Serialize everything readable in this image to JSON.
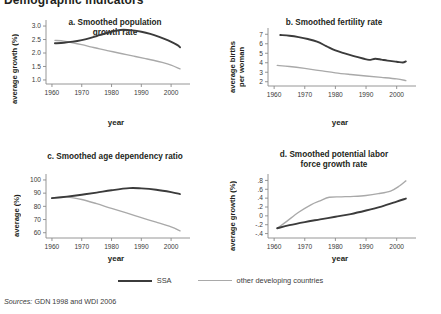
{
  "figure": {
    "main_title": "Demographic indicators",
    "source_prefix": "Sources:",
    "source_text": "GDN 1998 and WDI 2006"
  },
  "legend": {
    "position": "bottom-center",
    "entries": [
      {
        "label": "SSA",
        "color": "#3b3b3b",
        "width": 2.0
      },
      {
        "label": "other developing countries",
        "color": "#a9a9a9",
        "width": 1.4
      }
    ]
  },
  "chart_data": [
    {
      "id": "a",
      "type": "line",
      "title": "a. Smoothed population\ngrowth rate",
      "xlabel": "year",
      "ylabel": "average growth (%)",
      "xlim": [
        1958,
        2005
      ],
      "ylim": [
        0.85,
        3.15
      ],
      "xticks": [
        1960,
        1970,
        1980,
        1990,
        2000
      ],
      "yticks": [
        1.0,
        1.5,
        2.0,
        2.5,
        3.0
      ],
      "ytick_labels": [
        "1.0",
        "1.5",
        "2.0",
        "2.5",
        "3.0"
      ],
      "grid": false,
      "series": [
        {
          "name": "SSA",
          "color": "#3b3b3b",
          "x": [
            1961,
            1964,
            1967,
            1970,
            1973,
            1976,
            1979,
            1982,
            1984,
            1987,
            1990,
            1993,
            1996,
            1999,
            2002,
            2003
          ],
          "values": [
            2.36,
            2.38,
            2.42,
            2.48,
            2.56,
            2.66,
            2.76,
            2.84,
            2.86,
            2.84,
            2.79,
            2.71,
            2.6,
            2.47,
            2.3,
            2.21
          ]
        },
        {
          "name": "other developing countries",
          "color": "#a9a9a9",
          "x": [
            1961,
            1964,
            1967,
            1970,
            1973,
            1976,
            1979,
            1982,
            1985,
            1988,
            1991,
            1994,
            1997,
            2000,
            2003
          ],
          "values": [
            2.47,
            2.44,
            2.38,
            2.31,
            2.23,
            2.15,
            2.08,
            2.01,
            1.94,
            1.87,
            1.8,
            1.73,
            1.65,
            1.55,
            1.41
          ]
        }
      ]
    },
    {
      "id": "b",
      "type": "line",
      "title": "b. Smoothed fertility rate",
      "xlabel": "year",
      "ylabel": "average births\nper woman",
      "xlim": [
        1958,
        2005
      ],
      "ylim": [
        1.55,
        7.45
      ],
      "xticks": [
        1960,
        1970,
        1980,
        1990,
        2000
      ],
      "yticks": [
        2,
        3,
        4,
        5,
        6,
        7
      ],
      "ytick_labels": [
        "2",
        "3",
        "4",
        "5",
        "6",
        "7"
      ],
      "grid": false,
      "series": [
        {
          "name": "SSA",
          "color": "#3b3b3b",
          "x": [
            1962,
            1965,
            1968,
            1971,
            1974,
            1977,
            1980,
            1983,
            1986,
            1989,
            1991,
            1993,
            1995,
            1997,
            2000,
            2002,
            2003
          ],
          "values": [
            6.92,
            6.84,
            6.7,
            6.5,
            6.22,
            5.76,
            5.3,
            4.98,
            4.7,
            4.45,
            4.3,
            4.42,
            4.33,
            4.22,
            4.1,
            4.02,
            4.14
          ]
        },
        {
          "name": "other developing countries",
          "color": "#a9a9a9",
          "x": [
            1961,
            1965,
            1970,
            1975,
            1980,
            1985,
            1990,
            1995,
            2000,
            2003
          ],
          "values": [
            3.72,
            3.6,
            3.4,
            3.17,
            2.94,
            2.76,
            2.6,
            2.46,
            2.3,
            2.12
          ]
        }
      ]
    },
    {
      "id": "c",
      "type": "line",
      "title": "c. Smoothed age dependency ratio",
      "xlabel": "year",
      "ylabel": "average (%)",
      "xlim": [
        1958,
        2005
      ],
      "ylim": [
        56,
        103
      ],
      "xticks": [
        1960,
        1970,
        1980,
        1990,
        2000
      ],
      "yticks": [
        60,
        70,
        80,
        90,
        100
      ],
      "ytick_labels": [
        "60",
        "70",
        "80",
        "90",
        "100"
      ],
      "grid": false,
      "series": [
        {
          "name": "SSA",
          "color": "#3b3b3b",
          "x": [
            1960,
            1965,
            1970,
            1975,
            1980,
            1986,
            1990,
            1995,
            2000,
            2003
          ],
          "values": [
            86.2,
            87.4,
            88.8,
            90.4,
            92.2,
            93.8,
            93.6,
            92.6,
            90.8,
            89.3
          ]
        },
        {
          "name": "other developing countries",
          "color": "#a9a9a9",
          "x": [
            1960,
            1965,
            1970,
            1975,
            1980,
            1985,
            1990,
            1995,
            2000,
            2003
          ],
          "values": [
            86.4,
            87.0,
            85.2,
            82.0,
            78.4,
            75.0,
            71.4,
            68.0,
            64.4,
            61.4
          ]
        }
      ]
    },
    {
      "id": "d",
      "type": "line",
      "title": "d. Smoothed potential labor\nforce growth rate",
      "xlabel": "year",
      "ylabel": "average growth (%)",
      "xlim": [
        1958,
        2005
      ],
      "ylim": [
        -0.5,
        0.9
      ],
      "xticks": [
        1960,
        1970,
        1980,
        1990,
        2000
      ],
      "yticks": [
        -0.4,
        -0.2,
        0,
        0.2,
        0.4,
        0.6,
        0.8
      ],
      "ytick_labels": [
        "-.4",
        "-.2",
        "0",
        ".2",
        ".4",
        ".6",
        ".8"
      ],
      "grid": false,
      "series": [
        {
          "name": "SSA",
          "color": "#3b3b3b",
          "x": [
            1961,
            1965,
            1970,
            1975,
            1980,
            1985,
            1990,
            1995,
            2000,
            2003
          ],
          "values": [
            -0.28,
            -0.21,
            -0.14,
            -0.08,
            -0.02,
            0.04,
            0.12,
            0.21,
            0.32,
            0.39
          ]
        },
        {
          "name": "other developing countries",
          "color": "#a9a9a9",
          "x": [
            1961,
            1964,
            1968,
            1972,
            1975,
            1978,
            1982,
            1986,
            1990,
            1994,
            1998,
            2001,
            2003
          ],
          "values": [
            -0.28,
            -0.13,
            0.08,
            0.25,
            0.34,
            0.42,
            0.43,
            0.44,
            0.46,
            0.5,
            0.56,
            0.68,
            0.79
          ]
        }
      ]
    }
  ]
}
